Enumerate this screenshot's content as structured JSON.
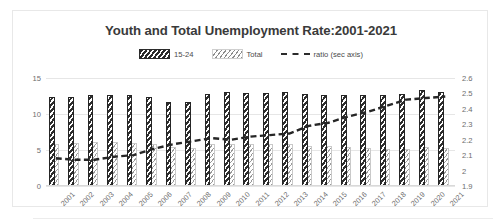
{
  "chart_data": {
    "type": "bar",
    "title": "Youth and Total Unemployment Rate:2001-2021",
    "xlabel": "",
    "ylabel": "",
    "categories": [
      "2001",
      "2002",
      "2003",
      "2004",
      "2005",
      "2006",
      "2007",
      "2008",
      "2009",
      "2010",
      "2011",
      "2012",
      "2013",
      "2014",
      "2015",
      "2016",
      "2017",
      "2018",
      "2019",
      "2020",
      "2021"
    ],
    "series": [
      {
        "name": "15-24",
        "axis": "primary",
        "values": [
          12.3,
          12.4,
          12.6,
          12.7,
          12.6,
          12.4,
          11.7,
          11.6,
          12.8,
          13.0,
          12.9,
          12.9,
          13.0,
          12.8,
          12.7,
          12.7,
          12.6,
          12.6,
          12.8,
          13.3,
          13.1
        ]
      },
      {
        "name": "Total",
        "axis": "primary",
        "values": [
          5.9,
          6.0,
          6.1,
          6.1,
          6.0,
          5.8,
          5.4,
          5.3,
          5.8,
          5.9,
          5.8,
          5.8,
          5.8,
          5.6,
          5.5,
          5.4,
          5.3,
          5.2,
          5.2,
          5.4,
          5.3
        ]
      },
      {
        "name": "ratio (sec axis)",
        "axis": "secondary",
        "values": [
          2.08,
          2.07,
          2.07,
          2.09,
          2.1,
          2.14,
          2.17,
          2.19,
          2.21,
          2.2,
          2.22,
          2.23,
          2.24,
          2.29,
          2.31,
          2.35,
          2.38,
          2.42,
          2.46,
          2.47,
          2.48
        ]
      }
    ],
    "ylim": [
      0,
      15
    ],
    "yticks": [
      "0",
      "5",
      "10",
      "15"
    ],
    "y2lim": [
      1.9,
      2.6
    ],
    "y2ticks": [
      "1.9",
      "2",
      "2.1",
      "2.2",
      "2.3",
      "2.4",
      "2.5",
      "2.6"
    ],
    "grid": true,
    "legend_position": "top"
  },
  "legend": {
    "entries": [
      {
        "label": "15-24",
        "icon": "hatched-bar-swatch"
      },
      {
        "label": "Total",
        "icon": "dotted-bar-swatch"
      },
      {
        "label": "ratio (sec axis)",
        "icon": "dashed-line-swatch"
      }
    ]
  }
}
